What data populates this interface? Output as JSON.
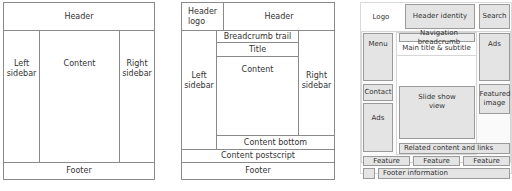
{
  "layout1": {
    "header": "Header",
    "left_sidebar": "Left sidebar",
    "content": "Content",
    "right_sidebar": "Right sidebar",
    "footer": "Footer"
  },
  "layout2": {
    "header_logo": "Header logo",
    "header": "Header",
    "breadcrumb": "Breadcrumb trail",
    "title": "Title",
    "content": "Content",
    "left_sidebar": "Left sidebar",
    "right_sidebar": "Right sidebar",
    "content_bottom": "Content bottom",
    "content_postscript": "Content postscript",
    "footer": "Footer"
  },
  "layout3": {
    "logo": "Logo",
    "header_identity": "Header identity",
    "search": "Search",
    "menu": "Menu",
    "navigation_breadcrumb": "Navigation breadcrumb",
    "main_title": "Main title & subtitle",
    "ads_right": "Ads",
    "contact": "Contact",
    "slideshow": "Slide show view",
    "featured_image": "Featured image",
    "ads_left": "Ads",
    "related": "Related content and links",
    "features": [
      "Feature",
      "Feature",
      "Feature"
    ],
    "footer_info": "Footer information"
  }
}
